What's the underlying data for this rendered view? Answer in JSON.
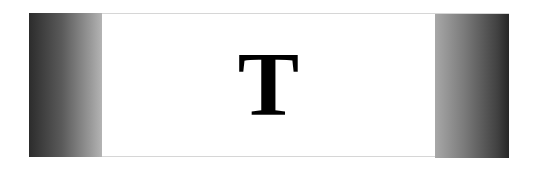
{
  "banner": {
    "letter": "T",
    "colors": {
      "background": "#ffffff",
      "panel_dark": "#262626",
      "panel_light": "#b4b4b4",
      "letter": "#000000"
    }
  }
}
